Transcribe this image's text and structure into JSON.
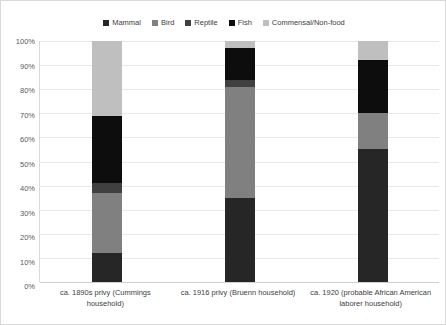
{
  "chart_data": {
    "type": "bar",
    "subtype": "stacked-waterfall",
    "title": "",
    "xlabel": "",
    "ylabel": "",
    "ylim": [
      0,
      100
    ],
    "y_unit": "%",
    "grid": true,
    "legend_position": "top-center",
    "categories": [
      "ca. 1890s privy (Cummings household)",
      "ca. 1916 privy (Bruenn household)",
      "ca. 1920 (probable African American laborer household)"
    ],
    "y_ticks": [
      "0%",
      "10%",
      "20%",
      "30%",
      "40%",
      "50%",
      "60%",
      "70%",
      "80%",
      "90%",
      "100%"
    ],
    "y_tick_values": [
      0,
      10,
      20,
      30,
      40,
      50,
      60,
      70,
      80,
      90,
      100
    ],
    "series": [
      {
        "name": "Mammal",
        "color": "#262626",
        "values": [
          12,
          35,
          55
        ],
        "starts": [
          0,
          0,
          0
        ],
        "ends": [
          12,
          35,
          55
        ]
      },
      {
        "name": "Bird",
        "color": "#808080",
        "values": [
          25,
          46,
          15
        ],
        "starts": [
          12,
          35,
          55
        ],
        "ends": [
          37,
          81,
          70
        ]
      },
      {
        "name": "Reptile",
        "color": "#404040",
        "values": [
          4,
          3,
          0
        ],
        "starts": [
          37,
          81,
          70
        ],
        "ends": [
          41,
          84,
          70
        ]
      },
      {
        "name": "Fish",
        "color": "#0d0d0d",
        "values": [
          28,
          13,
          22
        ],
        "starts": [
          41,
          84,
          70
        ],
        "ends": [
          69,
          97,
          92
        ]
      },
      {
        "name": "Commensal/Non-food",
        "color": "#bfbfbf",
        "values": [
          31,
          3,
          8
        ],
        "starts": [
          69,
          97,
          92
        ],
        "ends": [
          100,
          100,
          100
        ]
      }
    ]
  }
}
